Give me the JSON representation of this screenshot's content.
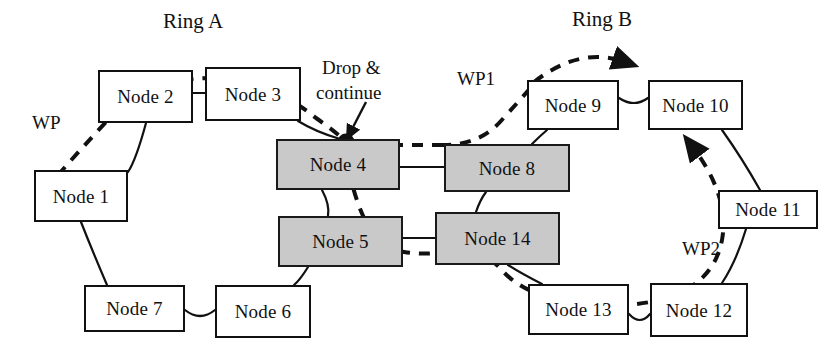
{
  "figure": {
    "type": "network-diagram",
    "title_labels": [
      {
        "id": "ring-a-title",
        "text": "Ring A"
      },
      {
        "id": "ring-b-title",
        "text": "Ring B"
      }
    ],
    "background_color": "#ffffff",
    "node_fill_plain": "#ffffff",
    "node_fill_shaded": "#c9c9c9",
    "stroke_color": "#111111"
  },
  "nodes": [
    {
      "id": "node-1",
      "label": "Node 1",
      "shaded": false,
      "x": 34,
      "y": 170,
      "w": 94,
      "h": 52
    },
    {
      "id": "node-2",
      "label": "Node 2",
      "shaded": false,
      "x": 98,
      "y": 70,
      "w": 95,
      "h": 53
    },
    {
      "id": "node-3",
      "label": "Node 3",
      "shaded": false,
      "x": 205,
      "y": 67,
      "w": 96,
      "h": 54
    },
    {
      "id": "node-4",
      "label": "Node 4",
      "shaded": true,
      "x": 276,
      "y": 139,
      "w": 124,
      "h": 51
    },
    {
      "id": "node-5",
      "label": "Node 5",
      "shaded": true,
      "x": 278,
      "y": 216,
      "w": 125,
      "h": 51
    },
    {
      "id": "node-6",
      "label": "Node 6",
      "shaded": false,
      "x": 215,
      "y": 285,
      "w": 96,
      "h": 53
    },
    {
      "id": "node-7",
      "label": "Node 7",
      "shaded": false,
      "x": 84,
      "y": 285,
      "w": 101,
      "h": 47
    },
    {
      "id": "node-8",
      "label": "Node 8",
      "shaded": true,
      "x": 444,
      "y": 144,
      "w": 126,
      "h": 48
    },
    {
      "id": "node-9",
      "label": "Node 9",
      "shaded": false,
      "x": 527,
      "y": 80,
      "w": 92,
      "h": 50
    },
    {
      "id": "node-10",
      "label": "Node 10",
      "shaded": false,
      "x": 648,
      "y": 80,
      "w": 95,
      "h": 50
    },
    {
      "id": "node-11",
      "label": "Node 11",
      "shaded": false,
      "x": 718,
      "y": 190,
      "w": 100,
      "h": 39
    },
    {
      "id": "node-12",
      "label": "Node 12",
      "shaded": false,
      "x": 650,
      "y": 283,
      "w": 98,
      "h": 54
    },
    {
      "id": "node-13",
      "label": "Node 13",
      "shaded": false,
      "x": 528,
      "y": 284,
      "w": 101,
      "h": 51
    },
    {
      "id": "node-14",
      "label": "Node 14",
      "shaded": true,
      "x": 435,
      "y": 212,
      "w": 125,
      "h": 53
    }
  ],
  "annotations": [
    {
      "id": "ring-a-title",
      "text": "Ring A",
      "x": 163,
      "y": 10,
      "kind": "ring-title"
    },
    {
      "id": "ring-b-title",
      "text": "Ring B",
      "x": 572,
      "y": 8,
      "kind": "ring-title"
    },
    {
      "id": "wp-label",
      "text": "WP",
      "x": 32,
      "y": 112,
      "kind": "path-label"
    },
    {
      "id": "wp1-label",
      "text": "WP1",
      "x": 457,
      "y": 68,
      "kind": "path-label"
    },
    {
      "id": "wp2-label",
      "text": "WP2",
      "x": 682,
      "y": 238,
      "kind": "path-label"
    },
    {
      "id": "drop-continue-line1",
      "text": "Drop &",
      "x": 322,
      "y": 57,
      "kind": "callout"
    },
    {
      "id": "drop-continue-line2",
      "text": "continue",
      "x": 316,
      "y": 82,
      "kind": "callout"
    }
  ],
  "ring_a": {
    "name": "Ring A",
    "members": [
      "Node 1",
      "Node 2",
      "Node 3",
      "Node 4",
      "Node 5",
      "Node 6",
      "Node 7"
    ],
    "interconnect_nodes": [
      "Node 4",
      "Node 5"
    ]
  },
  "ring_b": {
    "name": "Ring B",
    "members": [
      "Node 8",
      "Node 9",
      "Node 10",
      "Node 11",
      "Node 12",
      "Node 13",
      "Node 14"
    ],
    "interconnect_nodes": [
      "Node 8",
      "Node 14"
    ]
  },
  "links_solid": [
    {
      "from": "Node 1",
      "to": "Node 2"
    },
    {
      "from": "Node 2",
      "to": "Node 3"
    },
    {
      "from": "Node 3",
      "to": "Node 4"
    },
    {
      "from": "Node 4",
      "to": "Node 5"
    },
    {
      "from": "Node 5",
      "to": "Node 6"
    },
    {
      "from": "Node 6",
      "to": "Node 7"
    },
    {
      "from": "Node 7",
      "to": "Node 1"
    },
    {
      "from": "Node 4",
      "to": "Node 8"
    },
    {
      "from": "Node 5",
      "to": "Node 14"
    },
    {
      "from": "Node 8",
      "to": "Node 9"
    },
    {
      "from": "Node 9",
      "to": "Node 10"
    },
    {
      "from": "Node 10",
      "to": "Node 11"
    },
    {
      "from": "Node 11",
      "to": "Node 12"
    },
    {
      "from": "Node 12",
      "to": "Node 13"
    },
    {
      "from": "Node 13",
      "to": "Node 14"
    },
    {
      "from": "Node 14",
      "to": "Node 8"
    }
  ],
  "links_dashed": [
    {
      "id": "wp-path",
      "label": "WP",
      "route": [
        "Node 1",
        "Node 2",
        "Node 3",
        "Node 4",
        "Node 5",
        "Node 14"
      ]
    },
    {
      "id": "wp1-path",
      "label": "WP1",
      "route": [
        "Node 8",
        "Node 9",
        "Node 10"
      ]
    },
    {
      "id": "wp2-path",
      "label": "WP2",
      "route": [
        "Node 14",
        "Node 13",
        "Node 12",
        "Node 11",
        "Node 10"
      ]
    }
  ],
  "markers": {
    "drop_continue_dot": {
      "label": "Drop & continue",
      "at_node": "Node 4",
      "x": 346,
      "y": 141
    },
    "arrowheads": [
      {
        "id": "arrow-to-node-10-top",
        "x": 660,
        "y": 64
      },
      {
        "id": "arrow-to-node-10-bottom",
        "x": 684,
        "y": 135
      },
      {
        "id": "arrow-callout-drop",
        "x": 346,
        "y": 135
      }
    ]
  }
}
